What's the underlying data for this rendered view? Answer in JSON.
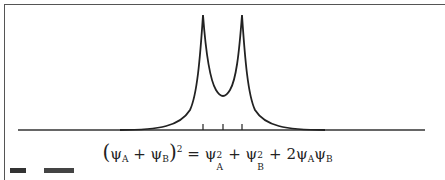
{
  "diagram": {
    "curve": {
      "type": "double-peak density",
      "peak_left_x": 203,
      "peak_right_x": 242,
      "peak_y": 15,
      "minimum_x": 223,
      "minimum_y": 96,
      "baseline_y": 130
    },
    "ticks_x": [
      203,
      223,
      242
    ],
    "colors": {
      "line": "#222222",
      "frame": "#555555",
      "background": "#ffffff"
    }
  },
  "equation": {
    "lhs_open": "(",
    "psi_a": "ψ",
    "sub_a": "A",
    "plus1": " + ",
    "psi_b": "ψ",
    "sub_b": "B",
    "lhs_close": ")",
    "lhs_exp": "2",
    "equals": " = ",
    "t1_psi": "ψ",
    "t1_sup": "2",
    "t1_sub": "A",
    "plus2": " + ",
    "t2_psi": "ψ",
    "t2_sup": "2",
    "t2_sub": "B",
    "plus3": " + 2",
    "t3_psi1": "ψ",
    "t3_sub1": "A",
    "t3_psi2": "ψ",
    "t3_sub2": "B"
  }
}
